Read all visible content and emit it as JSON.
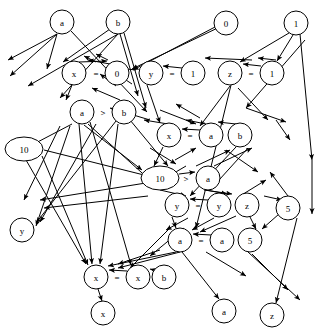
{
  "diagram": {
    "type": "directed-graph",
    "width": 319,
    "height": 331,
    "stroke_color": "#000000",
    "node_fill": "#ffffff",
    "nodes": [
      {
        "id": "n1",
        "label": "a",
        "shape": "circle",
        "cx": 62,
        "cy": 22,
        "r": 12
      },
      {
        "id": "n2",
        "label": "b",
        "shape": "circle",
        "cx": 118,
        "cy": 22,
        "r": 12
      },
      {
        "id": "n3",
        "label": "0",
        "shape": "circle",
        "cx": 226,
        "cy": 23,
        "r": 12
      },
      {
        "id": "n4",
        "label": "1",
        "shape": "circle",
        "cx": 296,
        "cy": 23,
        "r": 12
      },
      {
        "id": "n5",
        "label": "x",
        "shape": "circle",
        "cx": 74,
        "cy": 73,
        "r": 12
      },
      {
        "id": "n6",
        "label": "=",
        "shape": "operator",
        "cx": 96,
        "cy": 73,
        "r": 0
      },
      {
        "id": "n7",
        "label": "0",
        "shape": "circle",
        "cx": 117,
        "cy": 73,
        "r": 12
      },
      {
        "id": "n8",
        "label": "y",
        "shape": "circle",
        "cx": 151,
        "cy": 73,
        "r": 12
      },
      {
        "id": "n9",
        "label": "=",
        "shape": "operator",
        "cx": 172,
        "cy": 73,
        "r": 0
      },
      {
        "id": "n10",
        "label": "1",
        "shape": "circle",
        "cx": 193,
        "cy": 73,
        "r": 12
      },
      {
        "id": "n11",
        "label": "z",
        "shape": "circle",
        "cx": 230,
        "cy": 73,
        "r": 12
      },
      {
        "id": "n12",
        "label": "=",
        "shape": "operator",
        "cx": 251,
        "cy": 73,
        "r": 0
      },
      {
        "id": "n13",
        "label": "1",
        "shape": "circle",
        "cx": 272,
        "cy": 73,
        "r": 12
      },
      {
        "id": "n14",
        "label": "a",
        "shape": "circle",
        "cx": 82,
        "cy": 112,
        "r": 12
      },
      {
        "id": "n15",
        "label": ">",
        "shape": "operator",
        "cx": 103,
        "cy": 112,
        "r": 0
      },
      {
        "id": "n16",
        "label": "b",
        "shape": "circle",
        "cx": 124,
        "cy": 112,
        "r": 12
      },
      {
        "id": "n17",
        "label": "x",
        "shape": "circle",
        "cx": 169,
        "cy": 135,
        "r": 12
      },
      {
        "id": "n18",
        "label": "=",
        "shape": "operator",
        "cx": 190,
        "cy": 135,
        "r": 0
      },
      {
        "id": "n19",
        "label": "a",
        "shape": "circle",
        "cx": 211,
        "cy": 135,
        "r": 12
      },
      {
        "id": "n20",
        "label": "b",
        "shape": "circle",
        "cx": 240,
        "cy": 135,
        "r": 12
      },
      {
        "id": "n21",
        "label": "10",
        "shape": "ellipse",
        "cx": 24,
        "cy": 149,
        "rx": 19,
        "ry": 12
      },
      {
        "id": "n22",
        "label": "10",
        "shape": "ellipse",
        "cx": 160,
        "cy": 178,
        "rx": 19,
        "ry": 12
      },
      {
        "id": "n23",
        "label": ">",
        "shape": "operator",
        "cx": 186,
        "cy": 178,
        "r": 0
      },
      {
        "id": "n24",
        "label": "a",
        "shape": "circle",
        "cx": 208,
        "cy": 178,
        "r": 12
      },
      {
        "id": "n25",
        "label": "y",
        "shape": "circle",
        "cx": 177,
        "cy": 205,
        "r": 12
      },
      {
        "id": "n26",
        "label": "=",
        "shape": "operator",
        "cx": 198,
        "cy": 205,
        "r": 0
      },
      {
        "id": "n27",
        "label": "y",
        "shape": "circle",
        "cx": 219,
        "cy": 205,
        "r": 12
      },
      {
        "id": "n28",
        "label": "z",
        "shape": "circle",
        "cx": 247,
        "cy": 205,
        "r": 12
      },
      {
        "id": "n29",
        "label": "5",
        "shape": "circle",
        "cx": 288,
        "cy": 208,
        "r": 12
      },
      {
        "id": "n30",
        "label": "y",
        "shape": "circle",
        "cx": 22,
        "cy": 230,
        "r": 12
      },
      {
        "id": "n31",
        "label": "a",
        "shape": "circle",
        "cx": 180,
        "cy": 240,
        "r": 12
      },
      {
        "id": "n32",
        "label": "=",
        "shape": "operator",
        "cx": 201,
        "cy": 240,
        "r": 0
      },
      {
        "id": "n33",
        "label": "a",
        "shape": "circle",
        "cx": 222,
        "cy": 240,
        "r": 12
      },
      {
        "id": "n34",
        "label": "5",
        "shape": "circle",
        "cx": 250,
        "cy": 240,
        "r": 12
      },
      {
        "id": "n35",
        "label": "x",
        "shape": "circle",
        "cx": 96,
        "cy": 277,
        "r": 12
      },
      {
        "id": "n36",
        "label": "=",
        "shape": "operator",
        "cx": 117,
        "cy": 277,
        "r": 0
      },
      {
        "id": "n37",
        "label": "x",
        "shape": "circle",
        "cx": 138,
        "cy": 277,
        "r": 12
      },
      {
        "id": "n38",
        "label": "b",
        "shape": "circle",
        "cx": 164,
        "cy": 277,
        "r": 12
      },
      {
        "id": "n39",
        "label": "x",
        "shape": "circle",
        "cx": 103,
        "cy": 313,
        "r": 12
      },
      {
        "id": "n40",
        "label": "a",
        "shape": "circle",
        "cx": 224,
        "cy": 311,
        "r": 12
      },
      {
        "id": "n41",
        "label": "z",
        "shape": "circle",
        "cx": 272,
        "cy": 315,
        "r": 12
      }
    ],
    "edges": [
      {
        "from": "n1",
        "to": "n5",
        "path": "M 57 34 L 47 69"
      },
      {
        "from": "n1",
        "to": "n16",
        "path": "M 71 31 L 147 112"
      },
      {
        "from": "n2",
        "to": "n5",
        "path": "M 110 29 L 63 62"
      },
      {
        "from": "n2",
        "to": "n7",
        "path": "M 120 34 L 138 96"
      },
      {
        "from": "n2",
        "to": "n20",
        "path": "M 124 33 L 146 108"
      },
      {
        "from": "n3",
        "to": "n10",
        "path": "M 215 27 L 133 70"
      },
      {
        "from": "n4",
        "to": "n11",
        "path": "M 289 33 L 240 62"
      },
      {
        "from": "n4",
        "to": "n13",
        "path": "M 293 35 L 277 61"
      },
      {
        "from": "n5",
        "to": "n7",
        "path": "M 79 62 L 107 61"
      },
      {
        "from": "n5",
        "to": "n14",
        "path": "M 72 85 L 66 100"
      },
      {
        "from": "n7",
        "to": "n5",
        "path": "M 110 64 L 88 60"
      },
      {
        "from": "n8",
        "to": "n17",
        "path": "M 147 85 L 160 123"
      },
      {
        "from": "n10",
        "to": "n8",
        "path": "M 182 68 L 163 66"
      },
      {
        "from": "n11",
        "to": "n31",
        "path": "M 231 85 L 196 228"
      },
      {
        "from": "n13",
        "to": "n11",
        "path": "M 261 66 L 243 64"
      },
      {
        "from": "n14",
        "to": "n35",
        "path": "M 79 124 L 92 264"
      },
      {
        "from": "n14",
        "to": "n37",
        "path": "M 90 122 L 131 265"
      },
      {
        "from": "n16",
        "to": "n35",
        "path": "M 118 124 L 100 264"
      },
      {
        "from": "n16",
        "to": "n30",
        "path": "M 116 121 L 36 223"
      },
      {
        "from": "n17",
        "to": "n22",
        "path": "M 163 147 L 154 166"
      },
      {
        "from": "n19",
        "to": "n17",
        "path": "M 200 130 L 182 129"
      },
      {
        "from": "n20",
        "to": "n25",
        "path": "M 236 147 L 190 196"
      },
      {
        "from": "n21",
        "to": "n35",
        "path": "M 42 156 L 88 265"
      },
      {
        "from": "n22",
        "to": "n24",
        "path": "M 179 174 L 195 172"
      },
      {
        "from": "n24",
        "to": "n27",
        "path": "M 206 190 L 227 194"
      },
      {
        "from": "n25",
        "to": "n31",
        "path": "M 172 217 L 176 228"
      },
      {
        "from": "n27",
        "to": "n25",
        "path": "M 208 200 L 190 199"
      },
      {
        "from": "n28",
        "to": "n34",
        "path": "M 250 217 L 256 229"
      },
      {
        "from": "n29",
        "to": "n34",
        "path": "M 279 214 L 262 229"
      },
      {
        "from": "n31",
        "to": "n40",
        "path": "M 182 252 L 219 299"
      },
      {
        "from": "n33",
        "to": "n31",
        "path": "M 211 235 L 193 234"
      },
      {
        "from": "n35",
        "to": "n39",
        "path": "M 98 289 L 102 301"
      },
      {
        "from": "n37",
        "to": "n35",
        "path": "M 127 271 L 109 270"
      },
      {
        "from": "n38",
        "to": "n37",
        "path": "M 154 270 L 150 269"
      },
      {
        "from": "n29",
        "to": "n41",
        "path": "M 297 218 L 276 303"
      }
    ],
    "node_labels": [
      "a",
      "b",
      "0",
      "1",
      "x",
      "=",
      "0",
      "y",
      "=",
      "1",
      "z",
      "=",
      "1",
      "a",
      ">",
      "b",
      "x",
      "=",
      "a",
      "b",
      "10",
      "10",
      ">",
      "a",
      "y",
      "=",
      "y",
      "z",
      "5",
      "y",
      "a",
      "=",
      "a",
      "5",
      "x",
      "=",
      "x",
      "b",
      "x",
      "a",
      "z"
    ]
  }
}
